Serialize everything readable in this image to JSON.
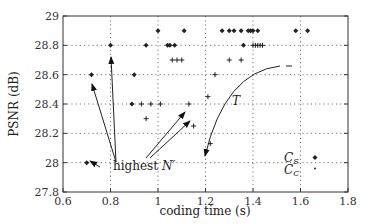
{
  "chart_data": {
    "type": "scatter",
    "title": "",
    "xlabel": "coding time (s)",
    "ylabel": "PSNR (dB)",
    "xlim": [
      0.6,
      1.8
    ],
    "ylim": [
      27.8,
      29.0
    ],
    "xticks": [
      0.6,
      0.8,
      1.0,
      1.2,
      1.4,
      1.6,
      1.8
    ],
    "xtick_labels": [
      "0.6",
      "0.8",
      "1",
      "1.2",
      "1.4",
      "1.6",
      "1.8"
    ],
    "yticks": [
      27.8,
      28.0,
      28.2,
      28.4,
      28.6,
      28.8,
      29.0
    ],
    "ytick_labels": [
      "27.8",
      "28",
      "28.2",
      "28.4",
      "28.6",
      "28.8",
      "29"
    ],
    "grid": "dotted",
    "legend_position": "inside lower right",
    "series": [
      {
        "name": "C_S",
        "marker": "diamond",
        "points": [
          [
            0.7,
            28.0
          ],
          [
            0.72,
            28.6
          ],
          [
            0.8,
            28.8
          ],
          [
            0.89,
            28.4
          ],
          [
            0.9,
            28.6
          ],
          [
            0.95,
            28.8
          ],
          [
            1.0,
            28.9
          ],
          [
            1.04,
            28.8
          ],
          [
            1.05,
            28.8
          ],
          [
            1.07,
            28.8
          ],
          [
            1.11,
            28.9
          ],
          [
            1.27,
            28.9
          ],
          [
            1.3,
            28.9
          ],
          [
            1.32,
            28.9
          ],
          [
            1.35,
            28.9
          ],
          [
            1.36,
            28.8
          ],
          [
            1.38,
            28.9
          ],
          [
            1.39,
            28.9
          ],
          [
            1.4,
            28.9
          ],
          [
            1.42,
            28.9
          ],
          [
            1.58,
            28.9
          ],
          [
            1.63,
            28.9
          ]
        ]
      },
      {
        "name": "C_C",
        "marker": "plus",
        "points": [
          [
            0.93,
            28.4
          ],
          [
            0.97,
            28.4
          ],
          [
            1.01,
            28.4
          ],
          [
            0.95,
            28.3
          ],
          [
            1.06,
            28.7
          ],
          [
            1.08,
            28.7
          ],
          [
            1.1,
            28.7
          ],
          [
            1.13,
            28.4
          ],
          [
            1.15,
            28.25
          ],
          [
            1.21,
            28.45
          ],
          [
            1.24,
            28.6
          ],
          [
            1.3,
            28.7
          ],
          [
            1.35,
            28.7
          ],
          [
            1.22,
            28.13
          ],
          [
            1.4,
            28.8
          ],
          [
            1.41,
            28.8
          ],
          [
            1.42,
            28.8
          ],
          [
            1.43,
            28.8
          ],
          [
            1.44,
            28.8
          ]
        ]
      }
    ],
    "annotations": [
      {
        "text": "highest N'",
        "x": 0.86,
        "y": 27.96
      },
      {
        "text": "T",
        "x": 1.28,
        "y": 28.37
      },
      {
        "text": "C_S",
        "x": 1.6,
        "y": 28.04,
        "legend": true
      },
      {
        "text": "C_C",
        "x": 1.6,
        "y": 27.98,
        "legend": true
      }
    ]
  },
  "labels": {
    "xlabel": "coding time (s)",
    "ylabel": "PSNR (dB)",
    "highest_prefix": "highest ",
    "highest_var": "N′",
    "curve_T": "T",
    "legend_cs": "C",
    "legend_cs_sub": "S",
    "legend_cc": "C",
    "legend_cc_sub": "C"
  }
}
